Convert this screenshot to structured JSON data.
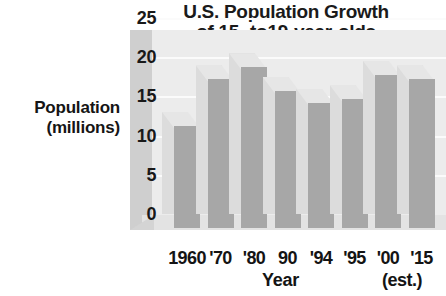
{
  "chart_data": {
    "type": "bar",
    "title": "U.S. Population Growth of 15- to19-year-olds",
    "title_lines": [
      "U.S. Population Growth",
      "of 15- to19-year-olds"
    ],
    "xlabel": "Year",
    "ylabel": "Population (millions)",
    "ylabel_lines": [
      "Population",
      "(millions)"
    ],
    "categories": [
      "1960",
      "'70",
      "'80",
      "90",
      "'94",
      "'95",
      "'00",
      "'15"
    ],
    "values": [
      13,
      19,
      20.5,
      17.5,
      16,
      16.5,
      19.5,
      19
    ],
    "ylim": [
      0,
      25
    ],
    "yticks": [
      0,
      5,
      10,
      15,
      20,
      25
    ],
    "ytick_labels": [
      "0",
      "5",
      "10",
      "15",
      "20",
      "25"
    ],
    "grid": true,
    "legend": "none",
    "annotations": [
      "(est.)"
    ],
    "note": "(est.)",
    "style": "3d-column",
    "colors": {
      "bar_front": "#a7a7a7",
      "bar_back": "#dcdcdc",
      "bar_top": "#e6e6e6",
      "plot_background": "#ececec",
      "axis_wall": "#cfcfcf",
      "gridline": "#fbfbfb",
      "text": "#141414"
    }
  }
}
